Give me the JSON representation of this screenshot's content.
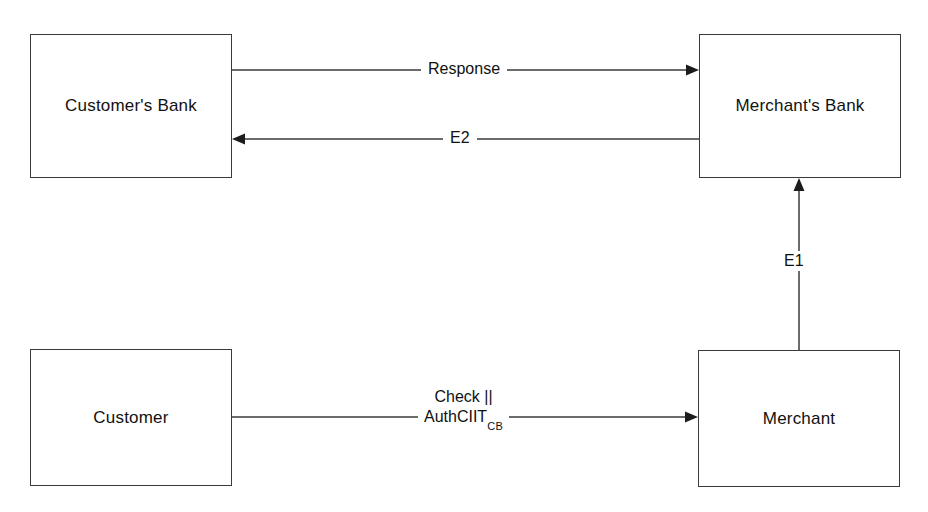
{
  "diagram": {
    "background_color": "#ffffff",
    "line_color": "#3a3a3a",
    "text_color": "#111111",
    "nodes": [
      {
        "id": "customers-bank",
        "label": "Customer's Bank",
        "x": 30,
        "y": 34,
        "width": 202,
        "height": 144
      },
      {
        "id": "merchants-bank",
        "label": "Merchant's Bank",
        "x": 699,
        "y": 34,
        "width": 202,
        "height": 144
      },
      {
        "id": "customer",
        "label": "Customer",
        "x": 30,
        "y": 349,
        "width": 202,
        "height": 137
      },
      {
        "id": "merchant",
        "label": "Merchant",
        "x": 698,
        "y": 350,
        "width": 202,
        "height": 137
      }
    ],
    "edges": [
      {
        "id": "response",
        "label": "Response",
        "from": "customers-bank",
        "to": "merchants-bank",
        "direction": "right",
        "y": 70
      },
      {
        "id": "e2",
        "label": "E2",
        "from": "merchants-bank",
        "to": "customers-bank",
        "direction": "left",
        "y": 139
      },
      {
        "id": "e1",
        "label": "E1",
        "from": "merchant",
        "to": "merchants-bank",
        "direction": "up",
        "x": 799
      },
      {
        "id": "check-auth",
        "label_line1": "Check  ||",
        "label_line2_main": "AuthCIIT",
        "label_line2_sub": "CB",
        "from": "customer",
        "to": "merchant",
        "direction": "right",
        "y": 417
      }
    ]
  }
}
